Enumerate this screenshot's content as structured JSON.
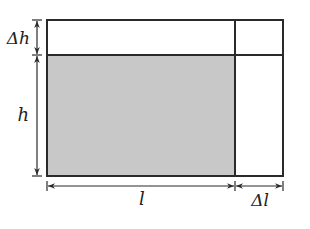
{
  "diagram": {
    "labels": {
      "delta_h": "Δh",
      "h": "h",
      "l": "l",
      "delta_l": "Δl"
    },
    "colors": {
      "stroke": "#2a2a2a",
      "shaded": "#c8c8c8",
      "background": "#ffffff"
    },
    "regions": [
      {
        "name": "original-area",
        "width": "l",
        "height": "h",
        "shaded": true
      },
      {
        "name": "top-strip",
        "width": "l",
        "height": "Δh",
        "shaded": false
      },
      {
        "name": "right-strip",
        "width": "Δl",
        "height": "h",
        "shaded": false
      },
      {
        "name": "corner",
        "width": "Δl",
        "height": "Δh",
        "shaded": false
      }
    ]
  }
}
